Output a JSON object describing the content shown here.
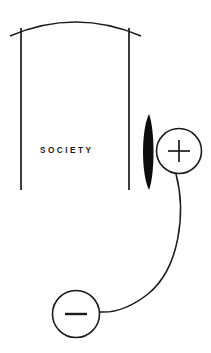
{
  "diagram": {
    "title_label": "SOCIETY",
    "background_color": "#ffffff",
    "ink_color": "#1a1a1a",
    "fill_color": "#0d0d0d",
    "elements": {
      "arch_label": "arch-canopy",
      "left_post_label": "left-post",
      "right_post_label": "right-post",
      "lens_label": "lens-shape",
      "plus_node_label": "+",
      "minus_node_label": "–",
      "connector_label": "connector-curve"
    },
    "geometry": {
      "arch_span_start_x": 10,
      "arch_span_end_x": 141,
      "arch_apex_y": 17,
      "post_top_y": 27,
      "post_bottom_y": 190,
      "left_post_x": 21,
      "right_post_x": 129,
      "label_x": 40,
      "label_baseline_y": 153,
      "lens_center_x": 148,
      "lens_center_y": 152,
      "lens_half_height": 38,
      "lens_half_width": 6,
      "plus_circle_cx": 179,
      "plus_circle_cy": 151,
      "plus_circle_r": 23,
      "minus_circle_cx": 76,
      "minus_circle_cy": 314,
      "minus_circle_r": 24,
      "connector_start_x": 176,
      "connector_start_y": 174,
      "connector_end_x": 100,
      "connector_end_y": 312
    }
  }
}
